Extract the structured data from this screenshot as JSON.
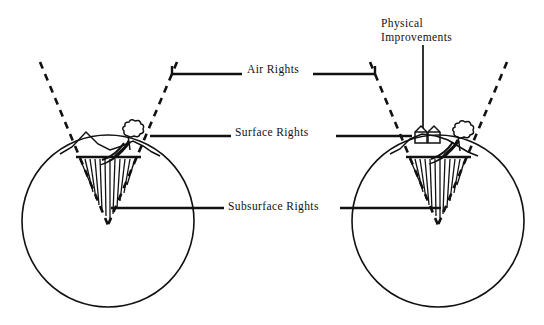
{
  "figure": {
    "background_color": "#ffffff",
    "ink_color": "#111111"
  },
  "labels": {
    "air_rights": "Air Rights",
    "surface_rights": "Surface Rights",
    "subsurface_rights": "Subsurface Rights",
    "physical_improvements_line1": "Physical",
    "physical_improvements_line2": "Improvements"
  },
  "diagrams": [
    {
      "name": "left-parcel",
      "circle": {
        "cx": 108,
        "cy": 221,
        "r": 86
      },
      "cone": {
        "apex_x": 108,
        "apex_y": 225,
        "left_top_x": 40,
        "left_top_y": 62,
        "right_top_x": 177,
        "right_top_y": 62
      },
      "surface_y": 155,
      "features": [
        "mountain",
        "stream",
        "tree"
      ],
      "has_buildings": false
    },
    {
      "name": "right-parcel",
      "circle": {
        "cx": 438,
        "cy": 221,
        "r": 86
      },
      "cone": {
        "apex_x": 438,
        "apex_y": 225,
        "left_top_x": 370,
        "left_top_y": 62,
        "right_top_x": 507,
        "right_top_y": 62
      },
      "surface_y": 155,
      "features": [
        "hill",
        "stream",
        "tree",
        "buildings"
      ],
      "has_buildings": true
    }
  ],
  "leaders": {
    "air_rights_left_to": "left parcel upper cone edge",
    "air_rights_right_to": "right parcel upper cone edge",
    "surface_rights_left_to": "left parcel surface",
    "surface_rights_right_to": "right parcel surface",
    "subsurface_rights_left_to": "left parcel wedge",
    "subsurface_rights_right_to": "right parcel wedge",
    "physical_improvements_to": "right parcel buildings"
  }
}
